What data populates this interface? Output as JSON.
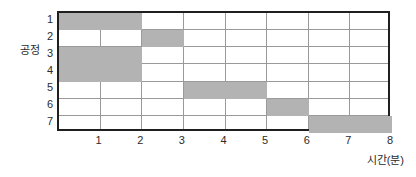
{
  "chart_data": {
    "type": "bar",
    "subtype": "gantt",
    "orientation": "horizontal",
    "title": "",
    "xlabel": "시간(분)",
    "ylabel": "공정",
    "xlim": [
      0,
      8
    ],
    "x_ticks": [
      "1",
      "2",
      "3",
      "4",
      "5",
      "6",
      "7",
      "8"
    ],
    "x_tick_values": [
      1,
      2,
      3,
      4,
      5,
      6,
      7,
      8
    ],
    "categories": [
      "1",
      "2",
      "3",
      "4",
      "5",
      "6",
      "7"
    ],
    "grid": true,
    "legend": false,
    "bar_color": "#b3b3b3",
    "border_color": "#1f1f1f",
    "gridline_color": "#9a9a9a",
    "background_color": "#ffffff",
    "tasks": [
      {
        "row": "1",
        "start": 0,
        "end": 2,
        "duration": 2
      },
      {
        "row": "2",
        "start": 2,
        "end": 3,
        "duration": 1
      },
      {
        "row": "3",
        "start": 0,
        "end": 2,
        "duration": 2
      },
      {
        "row": "4",
        "start": 0,
        "end": 2,
        "duration": 2
      },
      {
        "row": "5",
        "start": 3,
        "end": 5,
        "duration": 2
      },
      {
        "row": "6",
        "start": 5,
        "end": 6,
        "duration": 1
      },
      {
        "row": "7",
        "start": 6,
        "end": 8,
        "duration": 2
      }
    ]
  }
}
